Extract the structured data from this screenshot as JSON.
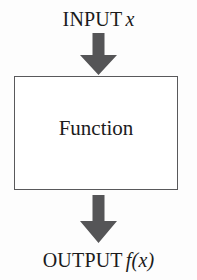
{
  "diagram": {
    "input": {
      "prefix": "INPUT",
      "variable": "x"
    },
    "process": {
      "label": "Function"
    },
    "output": {
      "prefix": "OUTPUT",
      "variable": "f(x)"
    },
    "arrows": [
      {
        "name": "input-arrow",
        "direction": "down"
      },
      {
        "name": "output-arrow",
        "direction": "down"
      }
    ],
    "colors": {
      "background": "#fdfdfd",
      "box_fill": "#ffffff",
      "box_border": "#59595b",
      "arrow_fill": "#555557",
      "text": "#1b1b1b"
    }
  }
}
